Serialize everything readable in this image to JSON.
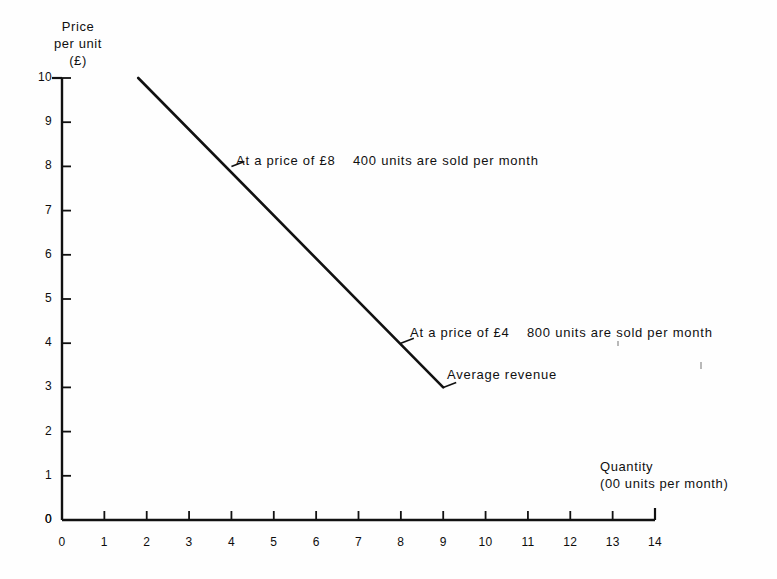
{
  "chart_data": {
    "type": "line",
    "title": "",
    "subtitle": "",
    "xlabel": "Quantity",
    "xlabel_sub": "(00 units per month)",
    "ylabel": "Price",
    "ylabel_line2": "per unit",
    "ylabel_line3": "(£)",
    "xlim": [
      0,
      14
    ],
    "ylim": [
      0,
      10
    ],
    "xticks": [
      0,
      1,
      2,
      3,
      4,
      5,
      6,
      7,
      8,
      9,
      10,
      11,
      12,
      13,
      14
    ],
    "xtick_labels": [
      "0",
      "1",
      "2",
      "3",
      "4",
      "5",
      "6",
      "7",
      "8",
      "9",
      "10",
      "11",
      "12",
      "13",
      "14"
    ],
    "yticks": [
      0,
      1,
      2,
      3,
      4,
      5,
      6,
      7,
      8,
      9,
      10
    ],
    "ytick_labels": [
      "0",
      "1",
      "2",
      "3",
      "4",
      "5",
      "6",
      "7",
      "8",
      "9",
      "10"
    ],
    "grid": false,
    "legend": null,
    "origin_label": "0",
    "series": [
      {
        "name": "Average revenue",
        "x": [
          1.8,
          9.0
        ],
        "y": [
          10.0,
          3.0
        ],
        "color": "#111111",
        "style": "solid",
        "width": 2.6
      }
    ],
    "annotations": [
      {
        "id": "high-price",
        "text": "At a price of £8    400 units are sold per month",
        "point_x": 4.0,
        "point_y": 8.0,
        "leader": true
      },
      {
        "id": "low-price",
        "text": "At a price of £4    800 units are sold per month",
        "point_x": 8.0,
        "point_y": 4.0,
        "leader": true
      },
      {
        "id": "curve-name",
        "text": "Average revenue",
        "point_x": 9.0,
        "point_y": 3.0,
        "leader": true
      }
    ]
  },
  "colors": {
    "ink": "#111111",
    "axis": "#111111",
    "background": "#fefefe"
  }
}
